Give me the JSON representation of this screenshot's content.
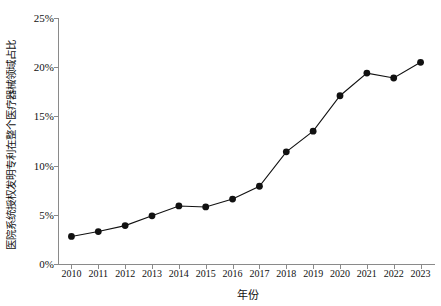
{
  "top_fragment": {
    "text": "—— ——— — —— ——— ——"
  },
  "chart_data": {
    "type": "line",
    "title": "",
    "xlabel": "年份",
    "ylabel": "医院系统授权发明专利在整个医疗器械领域占比",
    "categories": [
      "2010",
      "2011",
      "2012",
      "2013",
      "2014",
      "2015",
      "2016",
      "2017",
      "2018",
      "2019",
      "2020",
      "2021",
      "2022",
      "2023"
    ],
    "values": [
      2.8,
      3.3,
      3.9,
      4.9,
      5.9,
      5.8,
      6.6,
      7.9,
      11.4,
      13.5,
      17.1,
      19.4,
      18.9,
      20.5
    ],
    "ylim": [
      0,
      25
    ],
    "ytick_values": [
      0,
      5,
      10,
      15,
      20,
      25
    ],
    "ytick_labels": [
      "0%",
      "5%",
      "10%",
      "15%",
      "20%",
      "25%"
    ],
    "grid": false,
    "legend": null,
    "marker": "circle",
    "line_color": "#111111",
    "marker_color": "#111111"
  }
}
